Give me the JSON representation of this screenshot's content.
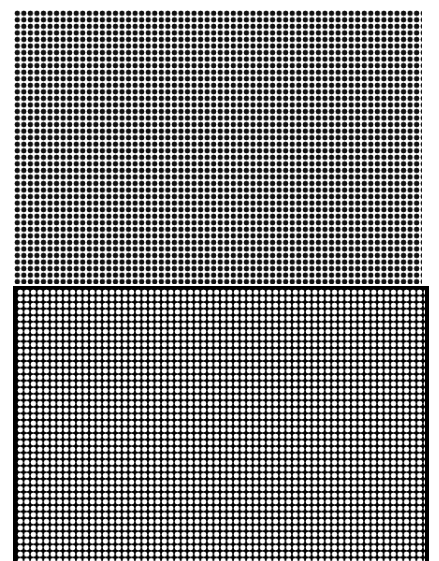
{
  "figure": {
    "top_panel": {
      "dot_color": "#111111",
      "background": "#ffffff",
      "pitch_px": 6.55
    },
    "bottom_panel": {
      "dot_color": "#ffffff",
      "background": "#000000",
      "pitch_px": 6.55
    }
  }
}
